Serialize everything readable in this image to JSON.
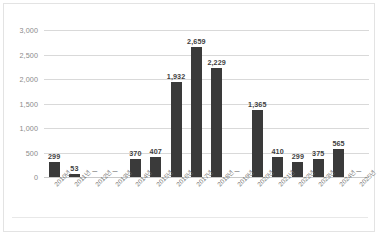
{
  "chart_data": {
    "type": "bar",
    "title": "",
    "subtitle": "",
    "xlabel": "",
    "ylabel": "",
    "ylim": [
      0,
      3000
    ],
    "grid": true,
    "legend": false,
    "legend_position": "none",
    "bar_color": "#3a3a3a",
    "gridline_color": "#d9d9d9",
    "null_marker": "–",
    "categories": [
      "2010년",
      "2011년",
      "2012년",
      "2013년",
      "2014년",
      "2015년",
      "2016년",
      "2017년",
      "2018년",
      "2019년",
      "2020년",
      "2021년",
      "2022년",
      "2023년",
      "2024년",
      "2025년"
    ],
    "values": [
      299,
      53,
      null,
      null,
      370,
      407,
      1932,
      2659,
      2229,
      null,
      1365,
      410,
      299,
      375,
      565,
      null
    ],
    "data_labels": [
      "299",
      "53",
      "–",
      "–",
      "370",
      "407",
      "1,932",
      "2,659",
      "2,229",
      "–",
      "1,365",
      "410",
      "299",
      "375",
      "565",
      "–"
    ],
    "y_ticks": [
      0,
      500,
      1000,
      1500,
      2000,
      2500,
      3000
    ],
    "y_tick_labels": [
      "0",
      "500",
      "1,000",
      "1,500",
      "2,000",
      "2,500",
      "3,000"
    ]
  }
}
